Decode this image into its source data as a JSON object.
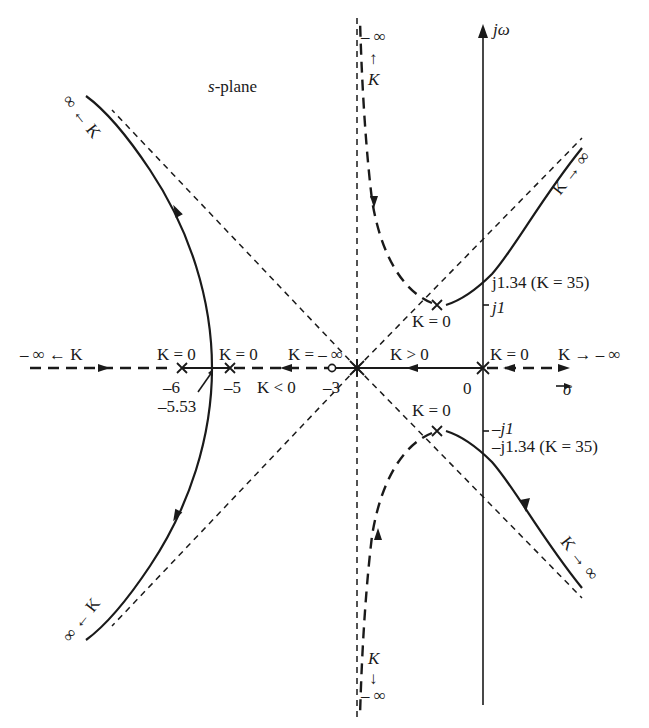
{
  "diagram": {
    "title": "s-plane",
    "title_italic_part": "s",
    "title_rest": "-plane",
    "axes": {
      "vertical_label": "jω",
      "horizontal_label": "σ",
      "origin_label": "0"
    },
    "real_axis_ticks": [
      {
        "value": -6,
        "label": "–6"
      },
      {
        "value": -5,
        "label": "–5"
      },
      {
        "value": -3,
        "label": "–3"
      },
      {
        "value": 0,
        "label": "0"
      }
    ],
    "imag_axis_ticks": [
      {
        "value": 1,
        "label": "j1"
      },
      {
        "value": -1,
        "label": "–j1"
      }
    ],
    "crossing_labels": {
      "upper": "j1.34 (K = 35)",
      "lower": "–j1.34 (K = 35)"
    },
    "breakaway": {
      "value": -5.53,
      "label": "–5.53"
    },
    "poles": [
      {
        "re": 0,
        "im": 0,
        "label": "K = 0"
      },
      {
        "re": -5,
        "im": 0,
        "label": "K = 0"
      },
      {
        "re": -6,
        "im": 0,
        "label": "K = 0"
      },
      {
        "re": -1,
        "im": 1,
        "label": "K = 0"
      },
      {
        "re": -1,
        "im": -1,
        "label": "K = 0"
      }
    ],
    "zeros": [
      {
        "re": -3,
        "im": 0
      }
    ],
    "asymptote_centroid": {
      "re": -2.5,
      "im": 0
    },
    "annotations": {
      "left_axis_end": "– ∞ ← K",
      "right_axis_end": "K → – ∞",
      "k_pos_segment": "K > 0",
      "k_neg_segment": "K < 0",
      "k_neg_inf_at_zero": "K = – ∞",
      "pole_k0": "K = 0",
      "top_left_branch": "∞ ← K",
      "bottom_left_branch": "∞ ← K",
      "top_right_branch": "K → ∞",
      "bottom_right_branch": "K → ∞",
      "top_neg_branch_k": "K",
      "top_neg_branch_inf": "– ∞",
      "top_neg_arrow": "↑",
      "bottom_neg_branch_k": "K",
      "bottom_neg_branch_inf": "– ∞",
      "bottom_neg_arrow": "↓"
    },
    "legend_styles": {
      "solid": "K > 0 root locus",
      "heavy_dashed": "K < 0 root locus",
      "light_dashed": "asymptotes"
    },
    "colors": {
      "ink": "#1a1a1a",
      "background": "#ffffff"
    }
  }
}
